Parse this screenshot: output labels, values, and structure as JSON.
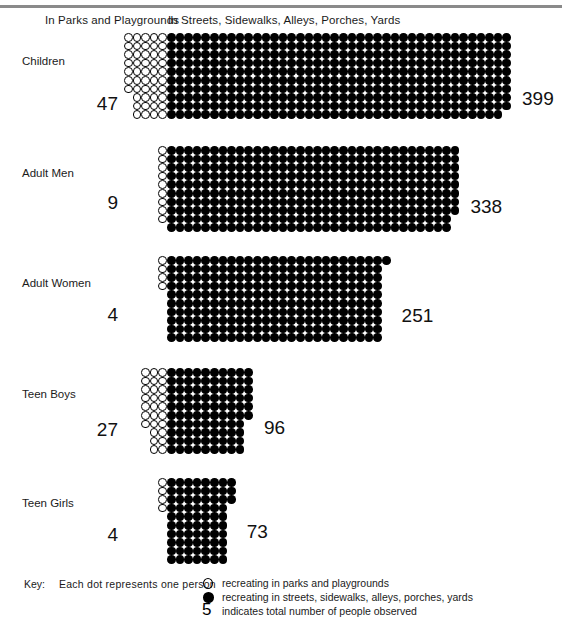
{
  "headers": {
    "parks": "In Parks and Playgrounds",
    "streets": "In Streets, Sidewalks, Alleys, Porches, Yards"
  },
  "key": {
    "word": "Key:",
    "lead": "Each dot represents one person",
    "rows": [
      {
        "glyph": "open-circle-icon",
        "text": "recreating in parks and playgrounds"
      },
      {
        "glyph": "filled-circle-icon",
        "text": "recreating in streets, sidewalks, alleys, porches, yards"
      },
      {
        "glyph": "numeral-five",
        "symbol": "5",
        "text": "indicates total number of people observed"
      }
    ]
  },
  "chart_data": {
    "type": "bar",
    "subtype": "pictogram",
    "title": "",
    "xlabel": "",
    "ylabel": "",
    "unit": "one dot = one person",
    "categories": [
      "Children",
      "Adult Men",
      "Adult Women",
      "Teen Boys",
      "Teen Girls"
    ],
    "series": [
      {
        "name": "In Parks and Playgrounds",
        "marker": "open-circle",
        "values": [
          47,
          9,
          4,
          27,
          4
        ]
      },
      {
        "name": "In Streets, Sidewalks, Alleys, Porches, Yards",
        "marker": "filled-circle",
        "values": [
          399,
          338,
          251,
          96,
          73
        ]
      }
    ],
    "legend_position": "bottom"
  },
  "groups": [
    {
      "label": "Children",
      "left_value": "47",
      "right_value": "399",
      "open_count": 47,
      "filled_count": 399,
      "open_cols": 5,
      "filled_cols": 40,
      "rows": 10
    },
    {
      "label": "Adult Men",
      "left_value": "9",
      "right_value": "338",
      "open_count": 9,
      "filled_count": 338,
      "open_cols": 1,
      "filled_cols": 34,
      "rows": 10
    },
    {
      "label": "Adult Women",
      "left_value": "4",
      "right_value": "251",
      "open_count": 4,
      "filled_count": 251,
      "open_cols": 1,
      "filled_cols": 26,
      "rows": 10
    },
    {
      "label": "Teen Boys",
      "left_value": "27",
      "right_value": "96",
      "open_count": 27,
      "filled_count": 96,
      "open_cols": 3,
      "filled_cols": 10,
      "rows": 10
    },
    {
      "label": "Teen Girls",
      "left_value": "4",
      "right_value": "73",
      "open_count": 4,
      "filled_count": 73,
      "open_cols": 1,
      "filled_cols": 8,
      "rows": 10
    }
  ],
  "layout": {
    "filled_origin_x": 167,
    "cell": 8.6,
    "group_tops": [
      33,
      146,
      256,
      368,
      478
    ],
    "label_tops": [
      55,
      167,
      277,
      388,
      497
    ],
    "left_num_right_edge": 118,
    "left_num_tops": [
      93,
      192,
      304,
      419,
      524
    ],
    "right_num_tops": [
      88,
      196,
      305,
      417,
      521
    ]
  },
  "colors": {
    "dot": "#000000",
    "text": "#1a1a1a",
    "rule": "#8a8a8a",
    "background": "#ffffff"
  }
}
